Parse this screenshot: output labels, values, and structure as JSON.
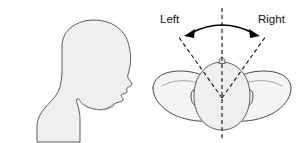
{
  "figure": {
    "panels": [
      {
        "id": "profile",
        "name": "head-profile-lateral-view",
        "description": "Lateral profile silhouette of a human head and neck facing right"
      },
      {
        "id": "superior",
        "name": "head-superior-view",
        "description": "Superior (top-down) view of head and shoulders with rotation arc"
      }
    ],
    "labels": {
      "left": "Left",
      "right": "Right"
    },
    "annotations": {
      "centerline_name": "midline-axis",
      "arc_name": "rotation-arc-arrow",
      "left_ray_name": "left-rotation-limit-ray",
      "right_ray_name": "right-rotation-limit-ray"
    },
    "colors": {
      "fill": "#efefef",
      "fill_light": "#f4f4f4",
      "outline": "#5a5a5a",
      "dash": "#1a1a1a",
      "arrow": "#000000",
      "text": "#111111",
      "background": "#ffffff"
    }
  }
}
